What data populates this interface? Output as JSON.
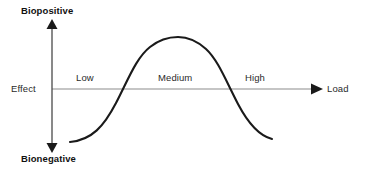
{
  "figure": {
    "title_visible": false,
    "background_color": "#ffffff"
  },
  "axes": {
    "vertical": {
      "top_label": "Biopositive",
      "bottom_label": "Bionegative",
      "origin_label": "Effect",
      "color": "#1a1a1a",
      "has_top_arrow": true,
      "has_bottom_arrow": true
    },
    "horizontal": {
      "end_label": "Load",
      "color": "#8c8c8c",
      "has_end_arrow": true,
      "arrow_color": "#1a1a1a"
    }
  },
  "zone_labels": [
    {
      "text": "Low"
    },
    {
      "text": "Medium"
    },
    {
      "text": "High"
    }
  ],
  "curve": {
    "color": "#1a1a1a",
    "stroke_width": "2.1",
    "path": "M 70,142 C 92,140 104,126 116,103 C 128,80 136,58 150,47 C 160,39 170,37 178,37 C 187,37 196,40 206,49 C 218,60 226,81 238,104 C 248,123 260,136 272,139"
  },
  "chart_data": {
    "type": "line",
    "title": "",
    "xlabel": "Load",
    "ylabel": "Effect",
    "ytick_labels": [
      "Bionegative",
      "Effect",
      "Biopositive"
    ],
    "xtick_labels": [
      "Low",
      "Medium",
      "High"
    ],
    "grid": false,
    "legend": "none",
    "series": [
      {
        "name": "Biological effect vs load (hormesis / inverted-U curve)",
        "x": [
          0.0,
          0.1,
          0.2,
          0.26,
          0.3,
          0.4,
          0.5,
          0.6,
          0.7,
          0.74,
          0.8,
          0.9,
          1.0
        ],
        "y": [
          -1.0,
          -0.82,
          -0.45,
          0.0,
          0.25,
          0.78,
          1.0,
          0.82,
          0.3,
          0.0,
          -0.4,
          -0.8,
          -0.95
        ]
      }
    ],
    "xlim": [
      0,
      1
    ],
    "ylim": [
      -1,
      1
    ],
    "zero_crossings": [
      0.26,
      0.74
    ],
    "peak": {
      "x": 0.52,
      "y": 1.0
    },
    "annotations": [
      {
        "text": "Low",
        "region": "x < 0.26",
        "effect": "bionegative"
      },
      {
        "text": "Medium",
        "region": "0.26 < x < 0.74",
        "effect": "biopositive"
      },
      {
        "text": "High",
        "region": "x > 0.74",
        "effect": "bionegative"
      }
    ]
  }
}
